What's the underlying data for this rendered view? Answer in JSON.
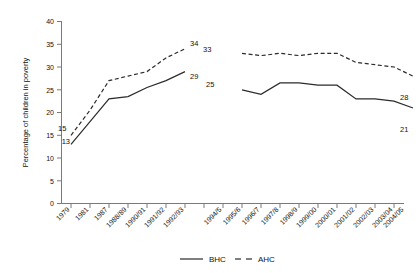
{
  "chart_data": {
    "type": "line",
    "title": "",
    "xlabel": "",
    "ylabel": "Percentage of children in poverty",
    "ylim": [
      0,
      40
    ],
    "ytick_step": 5,
    "yticks": [
      "0",
      "5",
      "10",
      "15",
      "20",
      "25",
      "30",
      "35",
      "40"
    ],
    "grid": false,
    "legend_position": "bottom-center",
    "categories": [
      "1979",
      "1981",
      "1987",
      "1988/89",
      "1990/91",
      "1991/92",
      "1992/93",
      "1994/5",
      "1995/6",
      "1996/7",
      "1997/8",
      "1998/9",
      "1999/00",
      "2000/01",
      "2001/02",
      "2002/03",
      "2003/04",
      "2004/05"
    ],
    "series": [
      {
        "name": "BHC",
        "style": "solid",
        "values": [
          13,
          18,
          23,
          23.5,
          25.5,
          27,
          29,
          null,
          25,
          24,
          26.5,
          26.5,
          26,
          26,
          23,
          23,
          22.5,
          21
        ]
      },
      {
        "name": "AHC",
        "style": "dashed",
        "values": [
          15,
          20.5,
          27,
          28,
          29,
          32,
          34,
          null,
          33,
          32.5,
          33,
          32.5,
          33,
          33,
          31,
          30.5,
          30,
          28
        ]
      }
    ],
    "annotations": [
      {
        "text": "13",
        "series": "BHC",
        "category": "1979",
        "value": 13
      },
      {
        "text": "15",
        "series": "AHC",
        "category": "1979",
        "value": 15
      },
      {
        "text": "29",
        "series": "BHC",
        "category": "1992/93",
        "value": 29
      },
      {
        "text": "34",
        "series": "AHC",
        "category": "1992/93",
        "value": 34
      },
      {
        "text": "25",
        "series": "BHC",
        "category": "1994/5",
        "value": 25
      },
      {
        "text": "33",
        "series": "AHC",
        "category": "1994/5",
        "value": 33
      },
      {
        "text": "21",
        "series": "BHC",
        "category": "2004/05",
        "value": 21
      },
      {
        "text": "28",
        "series": "AHC",
        "category": "2004/05",
        "value": 28
      }
    ],
    "note": "series are broken between 1992/93 and 1994/5"
  },
  "legend": {
    "items": [
      {
        "label": "BHC",
        "style": "solid"
      },
      {
        "label": "AHC",
        "style": "dashed"
      }
    ]
  },
  "colors": {
    "line": "#2b2b2b",
    "axis": "#7a7a7a",
    "background": "#ffffff",
    "text": "#111111"
  }
}
